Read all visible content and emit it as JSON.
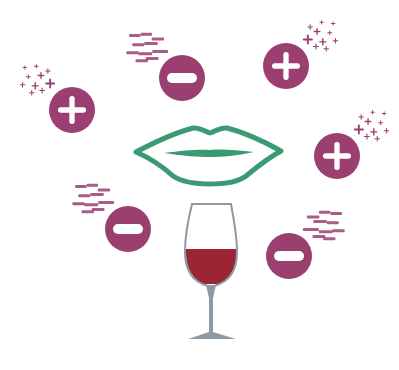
{
  "colors": {
    "badge": "#9a3f70",
    "badge_symbol": "#ffffff",
    "lips": "#3a9a72",
    "glass_outline": "#8e9aa3",
    "stem": "#8e9aa3",
    "wine": "#9b2435",
    "background": "#ffffff"
  },
  "badges": [
    {
      "type": "plus",
      "cx": 72,
      "cy": 110,
      "r": 23,
      "trail": "top-left"
    },
    {
      "type": "minus",
      "cx": 182,
      "cy": 78,
      "r": 23,
      "trail": "top-left"
    },
    {
      "type": "plus",
      "cx": 286,
      "cy": 66,
      "r": 23,
      "trail": "top-right"
    },
    {
      "type": "plus",
      "cx": 337,
      "cy": 156,
      "r": 23,
      "trail": "top-right"
    },
    {
      "type": "minus",
      "cx": 128,
      "cy": 229,
      "r": 23,
      "trail": "top-left"
    },
    {
      "type": "minus",
      "cx": 289,
      "cy": 256,
      "r": 23,
      "trail": "top-right"
    }
  ],
  "icons": {
    "lips": "lips-icon",
    "glass": "wine-glass-icon",
    "plus": "plus-badge-icon",
    "minus": "minus-badge-icon"
  }
}
